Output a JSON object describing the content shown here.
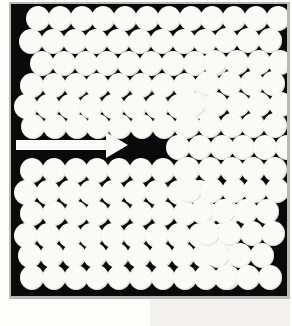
{
  "figure": {
    "panel_background_color": "#0a0a0a",
    "disc_color": "#fafaf6",
    "page_background_color": "#fdfdfb",
    "panel": {
      "x": 11,
      "y": 4,
      "width": 276,
      "height": 292
    },
    "disc_diameter": 24,
    "annotation": {
      "arrow": {
        "name": "direction-arrow",
        "label": "",
        "shaft": {
          "x": 16,
          "y": 140,
          "width": 92,
          "height": 10
        },
        "head": {
          "x": 106,
          "y": 132,
          "width": 22,
          "height": 26
        },
        "direction": "right",
        "color": "#fbfbf7"
      }
    },
    "clusters": [
      {
        "name": "left-upper-cluster",
        "rows": [
          {
            "y": 6,
            "x": 26,
            "count": 9
          },
          {
            "y": 29,
            "x": 19,
            "count": 9
          },
          {
            "y": 51,
            "x": 30,
            "count": 9
          },
          {
            "y": 73,
            "x": 20,
            "count": 9
          },
          {
            "y": 94,
            "x": 14,
            "count": 9
          },
          {
            "y": 114,
            "x": 21,
            "count": 8
          }
        ]
      },
      {
        "name": "left-lower-cluster",
        "rows": [
          {
            "y": 158,
            "x": 20,
            "count": 8
          },
          {
            "y": 180,
            "x": 14,
            "count": 9
          },
          {
            "y": 201,
            "x": 20,
            "count": 10
          },
          {
            "y": 223,
            "x": 14,
            "count": 10
          },
          {
            "y": 243,
            "x": 18,
            "count": 10
          },
          {
            "y": 265,
            "x": 20,
            "count": 10
          }
        ]
      },
      {
        "name": "right-cluster",
        "rows": [
          {
            "y": 6,
            "x": 222,
            "count": 3
          },
          {
            "y": 28,
            "x": 214,
            "count": 3
          },
          {
            "y": 50,
            "x": 203,
            "count": 4
          },
          {
            "y": 71,
            "x": 196,
            "count": 4
          },
          {
            "y": 92,
            "x": 182,
            "count": 5
          },
          {
            "y": 113,
            "x": 176,
            "count": 5
          },
          {
            "y": 135,
            "x": 166,
            "count": 6
          },
          {
            "y": 157,
            "x": 176,
            "count": 5
          },
          {
            "y": 178,
            "x": 178,
            "count": 5
          },
          {
            "y": 199,
            "x": 190,
            "count": 4
          },
          {
            "y": 221,
            "x": 196,
            "count": 4
          },
          {
            "y": 243,
            "x": 206,
            "count": 3
          },
          {
            "y": 265,
            "x": 214,
            "count": 3
          }
        ]
      }
    ],
    "counts": {
      "left_upper_total": 53,
      "left_lower_total": 57,
      "right_total": 54,
      "grand_total": 164
    }
  }
}
